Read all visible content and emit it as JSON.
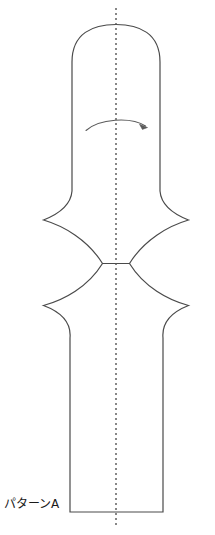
{
  "figure": {
    "title": "",
    "background_color": "#ffffff",
    "width": 215,
    "height": 535,
    "label": "パターンA",
    "label_position": {
      "x": 4,
      "y": 508
    }
  },
  "style": {
    "outline_color": "#4a4a4a",
    "outline_width": 1.2,
    "centerline_color": "#555555",
    "centerline_width": 1.3,
    "centerline_dash": "2 3",
    "arrow_color": "#5a5a5a",
    "arrow_width": 1.1,
    "label_color": "#1a1a1a",
    "label_font_size": 12
  },
  "shape": {
    "name": "hourglass-vessel-silhouette",
    "description": "Symmetric lathe/rotation profile: domed top, straight upper body, concave pinched waist with cusped points, flaring lower body, flat base",
    "axis_of_revolution": {
      "x": 116,
      "y_top": 8,
      "y_bottom": 528,
      "style": "dotted"
    },
    "outline_path": "M 72 60 C 72 30 94 24 116 24 C 138 24 160 30 160 60 L 160 190 C 160 205 175 214 188 220 C 170 226 145 240 129 263 L 103 263 C 87 240 62 226 43 220 C 56 214 72 205 72 190 Z M 72 335 C 72 320 56 311 43 305 C 62 299 87 286 103 263 L 129 263 C 145 286 170 299 188 305 C 175 311 163 320 163 335 L 163 512 L 70 512 L 70 335 Z",
    "key_points": {
      "dome_apex": {
        "x": 116,
        "y": 24
      },
      "upper_body_left": {
        "x": 72,
        "y": 60
      },
      "upper_body_right": {
        "x": 160,
        "y": 60
      },
      "upper_flare_left": {
        "x": 43,
        "y": 220
      },
      "upper_flare_right": {
        "x": 188,
        "y": 220
      },
      "waist_cusp_left": {
        "x": 103,
        "y": 263
      },
      "waist_cusp_right": {
        "x": 129,
        "y": 263
      },
      "lower_flare_left": {
        "x": 43,
        "y": 305
      },
      "lower_flare_right": {
        "x": 188,
        "y": 305
      },
      "lower_body_left": {
        "x": 70,
        "y": 345
      },
      "lower_body_right": {
        "x": 163,
        "y": 345
      },
      "base_left": {
        "x": 70,
        "y": 512
      },
      "base_right": {
        "x": 163,
        "y": 512
      }
    }
  },
  "annotations": {
    "rotation_arrow": {
      "name": "rotation-direction-arrow",
      "description": "Curved arrow indicating rotation about the vertical axis",
      "direction": "clockwise-right",
      "path": "M 86 130 C 100 118 132 116 146 126",
      "arrowhead": {
        "x": 146,
        "y": 126
      }
    }
  }
}
